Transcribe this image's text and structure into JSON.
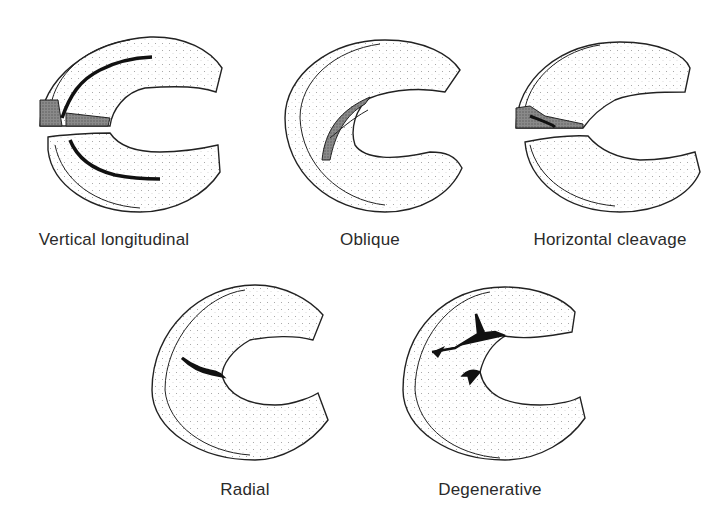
{
  "figure": {
    "panels": [
      {
        "id": "vertical-longitudinal",
        "label": "Vertical longitudinal"
      },
      {
        "id": "oblique",
        "label": "Oblique"
      },
      {
        "id": "horizontal-cleavage",
        "label": "Horizontal cleavage"
      },
      {
        "id": "radial",
        "label": "Radial"
      },
      {
        "id": "degenerative",
        "label": "Degenerative"
      }
    ],
    "colors": {
      "line": "#222222",
      "stipple": "#9a9a9a",
      "tear": "#111111",
      "shade": "#6e6e6e"
    }
  }
}
